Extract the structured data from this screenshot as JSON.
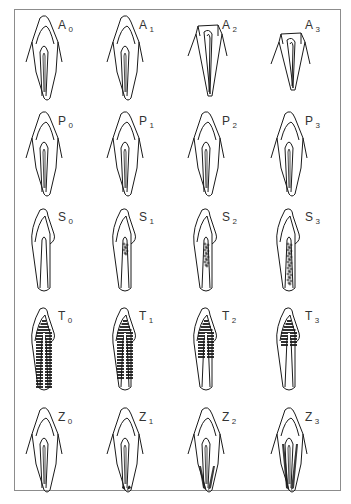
{
  "figure": {
    "rows": [
      {
        "key": "A",
        "description": "baseline tooth outline variants",
        "cells": [
          {
            "letter": "A",
            "index": "0",
            "variant": "plain"
          },
          {
            "letter": "A",
            "index": "1",
            "variant": "plain"
          },
          {
            "letter": "A",
            "index": "2",
            "variant": "flat-top"
          },
          {
            "letter": "A",
            "index": "3",
            "variant": "flat-top-short"
          }
        ]
      },
      {
        "key": "P",
        "description": "outline variants",
        "cells": [
          {
            "letter": "P",
            "index": "0",
            "variant": "plain"
          },
          {
            "letter": "P",
            "index": "1",
            "variant": "plain"
          },
          {
            "letter": "P",
            "index": "2",
            "variant": "plain"
          },
          {
            "letter": "P",
            "index": "3",
            "variant": "plain"
          }
        ]
      },
      {
        "key": "S",
        "description": "central stippled core increasing",
        "cells": [
          {
            "letter": "S",
            "index": "0",
            "variant": "slim"
          },
          {
            "letter": "S",
            "index": "1",
            "variant": "slim-stipple-small"
          },
          {
            "letter": "S",
            "index": "2",
            "variant": "slim-stipple-mid"
          },
          {
            "letter": "S",
            "index": "3",
            "variant": "slim-stipple-full"
          }
        ]
      },
      {
        "key": "T",
        "description": "horizontal hatching decreasing from full to upper part",
        "cells": [
          {
            "letter": "T",
            "index": "0",
            "variant": "hatch-full"
          },
          {
            "letter": "T",
            "index": "1",
            "variant": "hatch-most"
          },
          {
            "letter": "T",
            "index": "2",
            "variant": "hatch-half"
          },
          {
            "letter": "T",
            "index": "3",
            "variant": "hatch-top"
          }
        ]
      },
      {
        "key": "Z",
        "description": "dark basal shading increasing",
        "cells": [
          {
            "letter": "Z",
            "index": "0",
            "variant": "plain"
          },
          {
            "letter": "Z",
            "index": "1",
            "variant": "dark-tips"
          },
          {
            "letter": "Z",
            "index": "2",
            "variant": "dark-sides"
          },
          {
            "letter": "Z",
            "index": "3",
            "variant": "dark-sides-full"
          }
        ]
      }
    ],
    "colors": {
      "line": "#1a1a1a",
      "frame": "#8c8c8c",
      "label": "#333333",
      "background": "#ffffff"
    }
  }
}
